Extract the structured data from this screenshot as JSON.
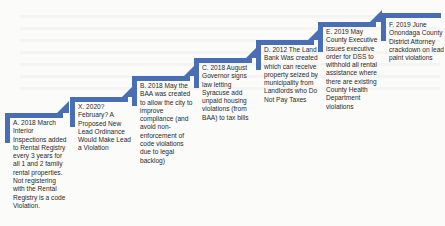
{
  "diagram": {
    "type": "step-up timeline",
    "accent_color": "#4a6eb3",
    "steps": [
      {
        "id": "A",
        "text": "A. 2018 March Interior Inspections added to Rental Registry every 3 years for all 1 and 2 family rental properties. Not registering with the Rental Registry is a code Violation."
      },
      {
        "id": "X",
        "text": "X. 2020? February? A Proposed New Lead Ordinance Would Make Lead a Violation"
      },
      {
        "id": "B",
        "text": "B. 2018 May the BAA was created to allow the city to improve compliance (and avoid non-enforcement of code violations due to legal backlog)"
      },
      {
        "id": "C",
        "text": "C. 2018 August Governor signs law letting Syracuse add unpaid housing violations (from BAA) to tax bills"
      },
      {
        "id": "D",
        "text": "D. 2012 The Land Bank Was created which can receive property seized by municipality from Landlords who Do Not Pay Taxes"
      },
      {
        "id": "E",
        "text": "E. 2019 May County Executive issues executive order for DSS to withhold all rental assistance where there are existing County Health Department violations"
      },
      {
        "id": "F",
        "text": "F. 2019 June Onondaga County District Attorney crackdown on lead paint violations"
      }
    ]
  }
}
